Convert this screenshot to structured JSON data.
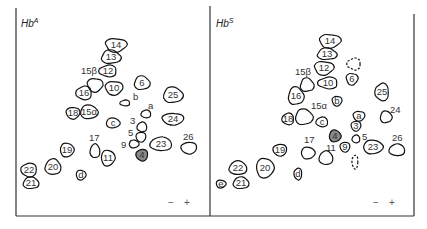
{
  "figure": {
    "panels": [
      {
        "id": "hba",
        "title": "Hb",
        "title_sup": "A",
        "polarity": {
          "minus": "−",
          "plus": "+"
        },
        "spots": [
          {
            "label": "14",
            "x": 116,
            "y": 45,
            "rx": 11,
            "ry": 7,
            "style": "solid",
            "label_inside": true
          },
          {
            "label": "13",
            "x": 111,
            "y": 57,
            "rx": 10,
            "ry": 7,
            "style": "solid",
            "label_inside": true
          },
          {
            "label": "12",
            "x": 108,
            "y": 71,
            "rx": 9,
            "ry": 6,
            "style": "solid",
            "label_inside": true
          },
          {
            "label": "",
            "x": 95,
            "y": 85,
            "rx": 8,
            "ry": 7,
            "style": "solid",
            "label_inside": false
          },
          {
            "label": "6",
            "x": 142,
            "y": 83,
            "rx": 8,
            "ry": 7,
            "style": "solid",
            "label_inside": true
          },
          {
            "label": "16",
            "x": 84,
            "y": 93,
            "rx": 8,
            "ry": 7,
            "style": "solid",
            "label_inside": true
          },
          {
            "label": "10",
            "x": 114,
            "y": 88,
            "rx": 9,
            "ry": 7,
            "style": "solid",
            "label_inside": true
          },
          {
            "label": "25",
            "x": 173,
            "y": 95,
            "rx": 10,
            "ry": 8,
            "style": "solid",
            "label_inside": true
          },
          {
            "label": "",
            "x": 125,
            "y": 103,
            "rx": 5,
            "ry": 3,
            "style": "solid",
            "label_inside": false
          },
          {
            "label": "18",
            "x": 73,
            "y": 113,
            "rx": 7,
            "ry": 6,
            "style": "solid",
            "label_inside": true
          },
          {
            "label": "15α",
            "x": 89,
            "y": 112,
            "rx": 9,
            "ry": 7,
            "style": "solid",
            "label_inside": true
          },
          {
            "label": "",
            "x": 146,
            "y": 114,
            "rx": 5,
            "ry": 4,
            "style": "solid",
            "label_inside": false
          },
          {
            "label": "24",
            "x": 173,
            "y": 119,
            "rx": 11,
            "ry": 6,
            "style": "solid",
            "label_inside": true
          },
          {
            "label": "c",
            "x": 113,
            "y": 123,
            "rx": 7,
            "ry": 5,
            "style": "solid",
            "label_inside": true
          },
          {
            "label": "",
            "x": 142,
            "y": 127,
            "rx": 5,
            "ry": 5,
            "style": "solid",
            "label_inside": false
          },
          {
            "label": "",
            "x": 141,
            "y": 137,
            "rx": 5,
            "ry": 5,
            "style": "solid",
            "label_inside": false
          },
          {
            "label": "",
            "x": 134,
            "y": 144,
            "rx": 5,
            "ry": 4,
            "style": "solid",
            "label_inside": false
          },
          {
            "label": "23",
            "x": 161,
            "y": 144,
            "rx": 11,
            "ry": 7,
            "style": "solid",
            "label_inside": true
          },
          {
            "label": "",
            "x": 189,
            "y": 148,
            "rx": 8,
            "ry": 6,
            "style": "solid",
            "label_inside": false
          },
          {
            "label": "19",
            "x": 67,
            "y": 150,
            "rx": 7,
            "ry": 7,
            "style": "solid",
            "label_inside": true
          },
          {
            "label": "",
            "x": 95,
            "y": 151,
            "rx": 5,
            "ry": 7,
            "style": "solid",
            "label_inside": false
          },
          {
            "label": "4",
            "x": 142,
            "y": 155,
            "rx": 6,
            "ry": 6,
            "style": "filled",
            "label_inside": true
          },
          {
            "label": "11",
            "x": 108,
            "y": 158,
            "rx": 7,
            "ry": 8,
            "style": "solid",
            "label_inside": true
          },
          {
            "label": "20",
            "x": 53,
            "y": 167,
            "rx": 8,
            "ry": 8,
            "style": "solid",
            "label_inside": true
          },
          {
            "label": "22",
            "x": 29,
            "y": 170,
            "rx": 8,
            "ry": 7,
            "style": "solid",
            "label_inside": true
          },
          {
            "label": "d",
            "x": 81,
            "y": 175,
            "rx": 5,
            "ry": 5,
            "style": "solid",
            "label_inside": true
          },
          {
            "label": "21",
            "x": 31,
            "y": 183,
            "rx": 8,
            "ry": 6,
            "style": "solid",
            "label_inside": true
          }
        ],
        "annotations": [
          {
            "text": "15β",
            "x": 81,
            "y": 74
          },
          {
            "text": "b",
            "x": 133,
            "y": 100
          },
          {
            "text": "a",
            "x": 148,
            "y": 109
          },
          {
            "text": "3",
            "x": 130,
            "y": 124
          },
          {
            "text": "5",
            "x": 128,
            "y": 136
          },
          {
            "text": "9",
            "x": 121,
            "y": 148
          },
          {
            "text": "17",
            "x": 89,
            "y": 141
          },
          {
            "text": "26",
            "x": 183,
            "y": 140
          }
        ]
      },
      {
        "id": "hbs",
        "title": "Hb",
        "title_sup": "S",
        "polarity": {
          "minus": "−",
          "plus": "+"
        },
        "spots": [
          {
            "label": "14",
            "x": 330,
            "y": 41,
            "rx": 11,
            "ry": 7,
            "style": "solid",
            "label_inside": true
          },
          {
            "label": "13",
            "x": 327,
            "y": 54,
            "rx": 10,
            "ry": 6,
            "style": "solid",
            "label_inside": true
          },
          {
            "label": "",
            "x": 354,
            "y": 64,
            "rx": 7,
            "ry": 6,
            "style": "dashed",
            "label_inside": false
          },
          {
            "label": "12",
            "x": 324,
            "y": 68,
            "rx": 10,
            "ry": 7,
            "style": "solid",
            "label_inside": true
          },
          {
            "label": "",
            "x": 307,
            "y": 85,
            "rx": 7,
            "ry": 7,
            "style": "solid",
            "label_inside": false
          },
          {
            "label": "10",
            "x": 328,
            "y": 83,
            "rx": 10,
            "ry": 6,
            "style": "solid",
            "label_inside": true
          },
          {
            "label": "6",
            "x": 352,
            "y": 79,
            "rx": 6,
            "ry": 6,
            "style": "solid",
            "label_inside": true
          },
          {
            "label": "16",
            "x": 296,
            "y": 96,
            "rx": 8,
            "ry": 9,
            "style": "solid",
            "label_inside": true
          },
          {
            "label": "25",
            "x": 382,
            "y": 92,
            "rx": 7,
            "ry": 9,
            "style": "solid",
            "label_inside": true
          },
          {
            "label": "b",
            "x": 337,
            "y": 101,
            "rx": 5,
            "ry": 5,
            "style": "solid",
            "label_inside": true
          },
          {
            "label": "",
            "x": 304,
            "y": 117,
            "rx": 9,
            "ry": 8,
            "style": "solid",
            "label_inside": false
          },
          {
            "label": "18",
            "x": 288,
            "y": 119,
            "rx": 6,
            "ry": 6,
            "style": "solid",
            "label_inside": true
          },
          {
            "label": "a",
            "x": 359,
            "y": 116,
            "rx": 6,
            "ry": 5,
            "style": "solid",
            "label_inside": true
          },
          {
            "label": "",
            "x": 386,
            "y": 117,
            "rx": 6,
            "ry": 6,
            "style": "solid",
            "label_inside": false
          },
          {
            "label": "c",
            "x": 322,
            "y": 122,
            "rx": 6,
            "ry": 5,
            "style": "solid",
            "label_inside": true
          },
          {
            "label": "3",
            "x": 356,
            "y": 126,
            "rx": 5,
            "ry": 5,
            "style": "solid",
            "label_inside": true
          },
          {
            "label": "4",
            "x": 335,
            "y": 136,
            "rx": 6,
            "ry": 6,
            "style": "filled",
            "label_inside": true
          },
          {
            "label": "",
            "x": 356,
            "y": 139,
            "rx": 4,
            "ry": 4,
            "style": "solid",
            "label_inside": false
          },
          {
            "label": "9",
            "x": 345,
            "y": 147,
            "rx": 5,
            "ry": 5,
            "style": "solid",
            "label_inside": true
          },
          {
            "label": "23",
            "x": 373,
            "y": 147,
            "rx": 10,
            "ry": 7,
            "style": "solid",
            "label_inside": true
          },
          {
            "label": "",
            "x": 397,
            "y": 150,
            "rx": 8,
            "ry": 6,
            "style": "solid",
            "label_inside": false
          },
          {
            "label": "19",
            "x": 280,
            "y": 150,
            "rx": 7,
            "ry": 6,
            "style": "solid",
            "label_inside": true
          },
          {
            "label": "",
            "x": 308,
            "y": 153,
            "rx": 7,
            "ry": 6,
            "style": "solid",
            "label_inside": false
          },
          {
            "label": "",
            "x": 326,
            "y": 158,
            "rx": 7,
            "ry": 7,
            "style": "solid",
            "label_inside": false
          },
          {
            "label": "",
            "x": 355,
            "y": 162,
            "rx": 3,
            "ry": 7,
            "style": "dashed",
            "label_inside": false
          },
          {
            "label": "20",
            "x": 265,
            "y": 168,
            "rx": 9,
            "ry": 10,
            "style": "solid",
            "label_inside": true
          },
          {
            "label": "22",
            "x": 238,
            "y": 168,
            "rx": 9,
            "ry": 7,
            "style": "solid",
            "label_inside": true
          },
          {
            "label": "d",
            "x": 298,
            "y": 174,
            "rx": 4,
            "ry": 6,
            "style": "solid",
            "label_inside": true
          },
          {
            "label": "e",
            "x": 221,
            "y": 184,
            "rx": 5,
            "ry": 4,
            "style": "solid",
            "label_inside": true
          },
          {
            "label": "21",
            "x": 241,
            "y": 183,
            "rx": 8,
            "ry": 6,
            "style": "solid",
            "label_inside": true
          }
        ],
        "annotations": [
          {
            "text": "15β",
            "x": 295,
            "y": 75
          },
          {
            "text": "15α",
            "x": 311,
            "y": 109
          },
          {
            "text": "24",
            "x": 390,
            "y": 113
          },
          {
            "text": "5",
            "x": 362,
            "y": 140
          },
          {
            "text": "17",
            "x": 304,
            "y": 143
          },
          {
            "text": "11",
            "x": 326,
            "y": 151
          },
          {
            "text": "26",
            "x": 392,
            "y": 141
          }
        ]
      }
    ]
  }
}
